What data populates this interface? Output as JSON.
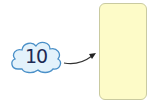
{
  "diagram": {
    "cloud": {
      "value": "10",
      "fill": "#e3f2fb",
      "stroke": "#4a90c8"
    },
    "arrow": {
      "color": "#333333",
      "direction": "cloud-to-box"
    },
    "answer_box": {
      "value": "",
      "fill": "#fdfbc8",
      "stroke": "#c9caa0"
    }
  }
}
